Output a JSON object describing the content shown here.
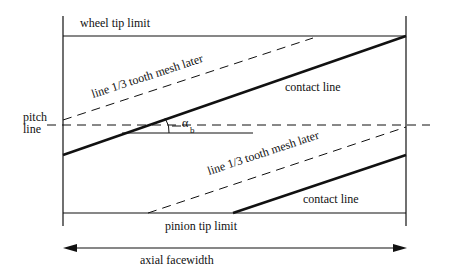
{
  "diagram": {
    "labels": {
      "wheel_tip_limit": "wheel tip limit",
      "pinion_tip_limit": "pinion tip limit",
      "pitch": "pitch",
      "line": "line",
      "upper_dashed": "line 1/3 tooth mesh later",
      "lower_dashed": "line 1/3 tooth mesh later",
      "upper_contact": "contact line",
      "lower_contact": "contact line",
      "angle_symbol": "α",
      "angle_subscript": "b",
      "axial_facewidth": "axial facewidth"
    },
    "colors": {
      "line": "#111111",
      "background": "#ffffff"
    }
  }
}
